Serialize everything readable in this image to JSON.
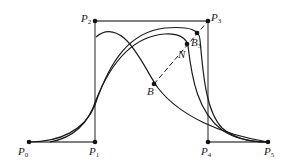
{
  "diagram": {
    "type": "bezier-subdivision",
    "colors": {
      "polygon": "#555555",
      "curve": "#1a1a1a",
      "point": "#111111"
    },
    "control_points": [
      {
        "id": "P0",
        "label": "P",
        "sub": "0",
        "x": 29,
        "y": 142
      },
      {
        "id": "P1",
        "label": "P",
        "sub": "1",
        "x": 95,
        "y": 142
      },
      {
        "id": "P2",
        "label": "P",
        "sub": "2",
        "x": 95,
        "y": 21
      },
      {
        "id": "P3",
        "label": "P",
        "sub": "3",
        "x": 208,
        "y": 21
      },
      {
        "id": "P4",
        "label": "P",
        "sub": "4",
        "x": 208,
        "y": 142
      },
      {
        "id": "P5",
        "label": "P",
        "sub": "5",
        "x": 268,
        "y": 142
      }
    ],
    "special_points": [
      {
        "id": "Q",
        "label": "",
        "sub": "",
        "x": 197,
        "y": 33
      },
      {
        "id": "B3",
        "label": "B",
        "sub": "3",
        "x": 187,
        "y": 44
      },
      {
        "id": "N",
        "label": "N",
        "sub": "",
        "x": 187,
        "y": 44
      },
      {
        "id": "B",
        "label": "B",
        "sub": "",
        "x": 154,
        "y": 84
      }
    ],
    "labels": {
      "p0": {
        "base": "P",
        "sub": "0"
      },
      "p1": {
        "base": "P",
        "sub": "1"
      },
      "p2": {
        "base": "P",
        "sub": "2"
      },
      "p3": {
        "base": "P",
        "sub": "3"
      },
      "p4": {
        "base": "P",
        "sub": "4"
      },
      "p5": {
        "base": "P",
        "sub": "5"
      },
      "b3": {
        "base": "B",
        "sub": "3"
      },
      "n": {
        "base": "N"
      },
      "b": {
        "base": "B"
      }
    }
  }
}
